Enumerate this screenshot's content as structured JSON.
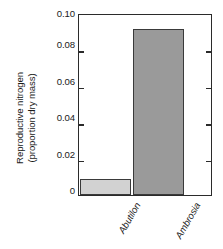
{
  "chart_data": {
    "type": "bar",
    "title": "",
    "subtitle": "",
    "xlabel": "",
    "ylabel": "Reproductive nitrogen (proportion dry mass)",
    "ylabel_lines": [
      "Reproductive nitrogen",
      "(proportion dry mass)"
    ],
    "categories": [
      "Abutilon",
      "Ambrosia"
    ],
    "values": [
      0.009,
      0.092
    ],
    "ylim": [
      0,
      0.1
    ],
    "ytick_labels": [
      "0",
      "0.02",
      "0.04",
      "0.06",
      "0.08",
      "0.10"
    ],
    "ytick_values": [
      0,
      0.02,
      0.04,
      0.06,
      0.08,
      0.1
    ],
    "grid": false,
    "legend": false,
    "legend_position": "none",
    "bar_colors": [
      "#d2d2d2",
      "#9a9a9a"
    ],
    "bar_edge_color": "#3a3a3a",
    "axis_color": "#2b2b2b",
    "background": "#ffffff",
    "categories_italic": true,
    "category_label_rotation": -60,
    "ticks_both_sides": true,
    "tick_direction": "in"
  }
}
